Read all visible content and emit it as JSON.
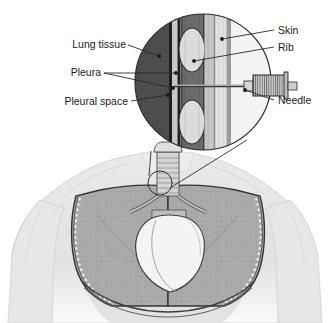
{
  "labels": {
    "lung_tissue": "Lung tissue",
    "pleura": "Pleura",
    "pleural_space": "Pleural space",
    "skin": "Skin",
    "rib": "Rib",
    "needle": "Needle"
  },
  "icons": {
    "magnifier": "magnifier-circle-icon",
    "syringe": "syringe-needle-icon",
    "torso": "human-torso-icon",
    "lung_left": "left-lung-icon",
    "lung_right": "right-lung-icon",
    "heart": "heart-icon",
    "trachea": "trachea-icon",
    "callout_marker": "callout-origin-circle-icon"
  },
  "colors": {
    "line": "#2b2b2b",
    "text": "#1a1a1a",
    "background": "#ffffff",
    "skin_outer": "#f0f0f0",
    "skin_band": "#e8e8e8",
    "fat_band": "#d0d0d0",
    "muscle_band": "#9a9a9a",
    "pleura_band": "#6e6e6e",
    "pleural_space": "#c9c9c9",
    "lung_tissue": "#4a4a4a",
    "rib_fill": "#dcdcdc",
    "body_fill": "#e4e4e4",
    "body_shade": "#cfcfcf",
    "lung_fill": "#a8a8a8",
    "heart_fill": "#f2f2f2",
    "cavity_line": "#3a3a3a"
  },
  "anatomy_layers": [
    {
      "name": "Lung tissue",
      "order": 1,
      "shade": "dark"
    },
    {
      "name": "Pleura (visceral)",
      "order": 2,
      "shade": "mid-dark"
    },
    {
      "name": "Pleural space",
      "order": 3,
      "shade": "light"
    },
    {
      "name": "Pleura (parietal)",
      "order": 4,
      "shade": "mid-dark"
    },
    {
      "name": "Rib / muscle",
      "order": 5,
      "shade": "mid"
    },
    {
      "name": "Skin",
      "order": 6,
      "shade": "lightest"
    }
  ],
  "ribs": [
    {
      "position": "upper",
      "label": "Rib"
    },
    {
      "position": "lower",
      "label": "Rib"
    }
  ]
}
